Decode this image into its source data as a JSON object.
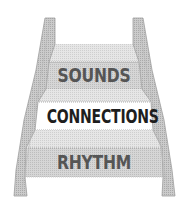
{
  "diagram": {
    "type": "staircase",
    "steps": [
      {
        "label": "SOUNDS",
        "level": "top"
      },
      {
        "label": "CONNECTIONS",
        "level": "middle",
        "highlighted": true
      },
      {
        "label": "RHYTHM",
        "level": "bottom"
      }
    ]
  },
  "colors": {
    "rail": "#c8c8c8",
    "rail_edge": "#a8a8a8",
    "tread": "#e2e2e2",
    "riser": "#d2d2d2",
    "highlight_riser": "#ffffff",
    "text_dark": "#1e1e1e",
    "text_muted": "#555555"
  }
}
